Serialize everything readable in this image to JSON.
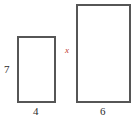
{
  "figure": {
    "background_color": "#ffffff",
    "stroke_color": "#565656",
    "text_color": "#2b2b2b",
    "variable_color": "#c0392b",
    "shapes": [
      {
        "name": "small-rectangle",
        "height_label": "7",
        "width_label": "4"
      },
      {
        "name": "large-rectangle",
        "height_label": "x",
        "width_label": "6"
      }
    ]
  },
  "chart_data": {
    "type": "diagram",
    "title": "",
    "shapes": [
      {
        "shape": "rectangle",
        "id": "small-rectangle",
        "width": 4,
        "height": 7,
        "width_label": "4",
        "height_label": "7",
        "label_positions": {
          "height": "left",
          "width": "bottom"
        },
        "pixel_box": {
          "x": 17,
          "y": 36,
          "w": 39,
          "h": 67
        }
      },
      {
        "shape": "rectangle",
        "id": "large-rectangle",
        "width": 6,
        "height": "x",
        "width_label": "6",
        "height_label": "x",
        "height_label_is_variable": true,
        "label_positions": {
          "height": "left",
          "width": "bottom"
        },
        "pixel_box": {
          "x": 76,
          "y": 4,
          "w": 55,
          "h": 99
        }
      }
    ],
    "annotations": [
      "7",
      "4",
      "x",
      "6"
    ]
  }
}
